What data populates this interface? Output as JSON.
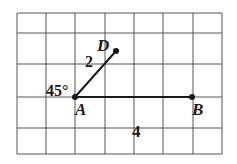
{
  "diagram": {
    "grid": {
      "x_lines": [
        17,
        46,
        75,
        105,
        134,
        163,
        193,
        222
      ],
      "y_lines": [
        13,
        33,
        64,
        97,
        128,
        154
      ],
      "color": "#555555"
    },
    "points": {
      "A": {
        "label": "A",
        "x": 75,
        "y": 97
      },
      "B": {
        "label": "B",
        "x": 192,
        "y": 97
      },
      "D": {
        "label": "D",
        "x": 116,
        "y": 51
      }
    },
    "segments": [
      {
        "from": "A",
        "to": "B"
      },
      {
        "from": "A",
        "to": "D"
      }
    ],
    "annotations": {
      "angle": "45°",
      "ad_length": "2",
      "ab_length": "4"
    },
    "line_color": "#1a1a1a"
  }
}
